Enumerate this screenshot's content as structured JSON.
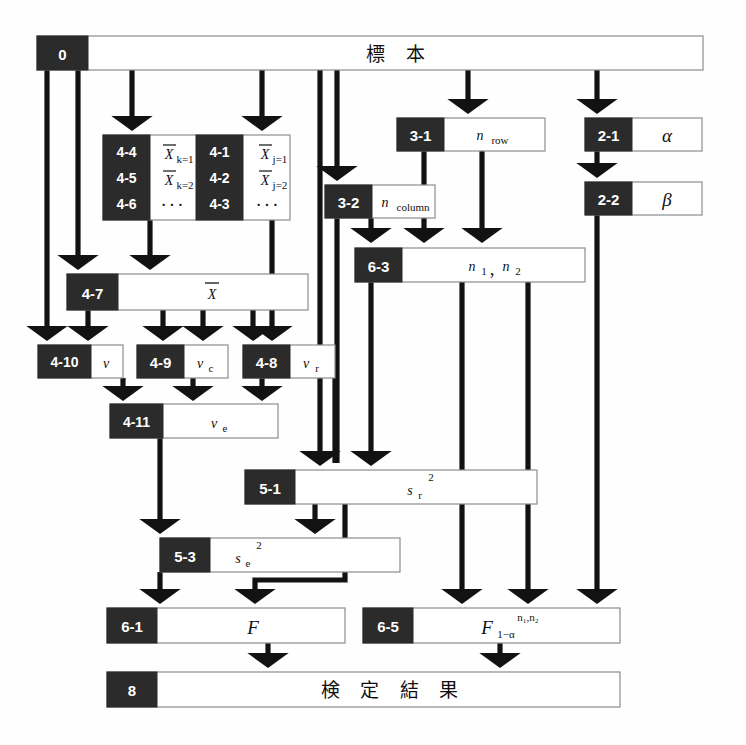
{
  "diagram": {
    "type": "flowchart",
    "background": "#ffffff",
    "tag_color": "#2b2b2b",
    "box_color": "#ffffff",
    "border_color": "#8d8d8d",
    "line_color": "#121212"
  },
  "nodes": {
    "sample": {
      "tag": "0",
      "label": "標 本"
    },
    "xbar_k1": {
      "tag": "4-4",
      "label": "X",
      "sub": "k=1",
      "overline": true
    },
    "xbar_k2": {
      "tag": "4-5",
      "label": "X",
      "sub": "k=2",
      "overline": true
    },
    "xbar_kdots": {
      "tag": "4-6",
      "label": "···"
    },
    "xbar_j1": {
      "tag": "4-1",
      "label": "X",
      "sub": "j=1",
      "overline": true
    },
    "xbar_j2": {
      "tag": "4-2",
      "label": "X",
      "sub": "j=2",
      "overline": true
    },
    "xbar_jdots": {
      "tag": "4-3",
      "label": "···"
    },
    "n_row": {
      "tag": "3-1",
      "label": "n",
      "sub": "row"
    },
    "n_column": {
      "tag": "3-2",
      "label": "n",
      "sub": "column"
    },
    "alpha": {
      "tag": "2-1",
      "label": "α"
    },
    "beta": {
      "tag": "2-2",
      "label": "β"
    },
    "n1n2": {
      "tag": "6-3",
      "label": "n",
      "sub1": "1",
      "label2": "n",
      "sub2": "2"
    },
    "grand_mean": {
      "tag": "4-7",
      "label": "X",
      "overline": true
    },
    "nu": {
      "tag": "4-10",
      "label": "v"
    },
    "nu_c": {
      "tag": "4-9",
      "label": "v",
      "sub": "c"
    },
    "nu_r": {
      "tag": "4-8",
      "label": "v",
      "sub": "r"
    },
    "nu_e": {
      "tag": "4-11",
      "label": "v",
      "sub": "e"
    },
    "s_r2": {
      "tag": "5-1",
      "label": "s",
      "sub": "r",
      "sup": "2"
    },
    "s_e2": {
      "tag": "5-3",
      "label": "s",
      "sub": "e",
      "sup": "2"
    },
    "F": {
      "tag": "6-1",
      "label": "F"
    },
    "F_crit": {
      "tag": "6-5",
      "label": "F",
      "sub": "1−α",
      "sup": "n₁,n₂"
    },
    "result": {
      "tag": "8",
      "label": "検 定 結 果"
    }
  },
  "edges": [
    {
      "from": "sample",
      "to": "nu"
    },
    {
      "from": "sample",
      "to": "grand_mean"
    },
    {
      "from": "sample",
      "to": "xbar_k_group"
    },
    {
      "from": "sample",
      "to": "xbar_j_group"
    },
    {
      "from": "sample",
      "to": "n_column"
    },
    {
      "from": "sample",
      "to": "n_row"
    },
    {
      "from": "sample",
      "to": "alpha"
    },
    {
      "from": "sample",
      "to": "s_r2"
    },
    {
      "from": "xbar_k_group",
      "to": "grand_mean"
    },
    {
      "from": "xbar_j_group",
      "to": "nu_r"
    },
    {
      "from": "grand_mean",
      "to": "nu"
    },
    {
      "from": "grand_mean",
      "to": "nu_c"
    },
    {
      "from": "grand_mean",
      "to": "nu_c"
    },
    {
      "from": "grand_mean",
      "to": "nu_r"
    },
    {
      "from": "n_row",
      "to": "n1n2"
    },
    {
      "from": "n_row",
      "to": "n1n2"
    },
    {
      "from": "n_column",
      "to": "n1n2"
    },
    {
      "from": "n_column",
      "to": "s_r2"
    },
    {
      "from": "alpha",
      "to": "beta"
    },
    {
      "from": "beta",
      "to": "F_crit"
    },
    {
      "from": "n1n2",
      "to": "s_r2"
    },
    {
      "from": "n1n2",
      "to": "F_crit"
    },
    {
      "from": "n1n2",
      "to": "F_crit"
    },
    {
      "from": "nu",
      "to": "nu_e"
    },
    {
      "from": "nu_c",
      "to": "nu_e"
    },
    {
      "from": "nu_r",
      "to": "nu_e"
    },
    {
      "from": "nu_r",
      "to": "s_r2"
    },
    {
      "from": "nu_e",
      "to": "s_e2"
    },
    {
      "from": "s_r2",
      "to": "s_e2"
    },
    {
      "from": "s_r2",
      "to": "F"
    },
    {
      "from": "s_e2",
      "to": "F"
    },
    {
      "from": "F",
      "to": "result"
    },
    {
      "from": "F_crit",
      "to": "result"
    }
  ]
}
